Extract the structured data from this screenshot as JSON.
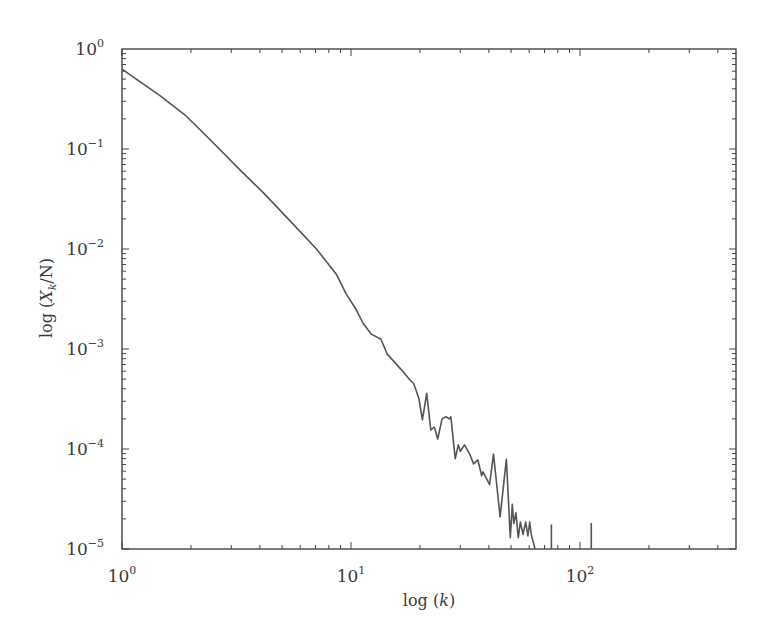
{
  "chart_data": {
    "type": "line",
    "title": "",
    "xlabel": "log (k)",
    "ylabel": "log (X_k/N)",
    "xscale": "log",
    "yscale": "log",
    "xlim": [
      1,
      480
    ],
    "ylim": [
      1e-05,
      1
    ],
    "grid": false,
    "legend": null,
    "x_ticks": [
      {
        "value": 1,
        "base": "10",
        "exp": "0"
      },
      {
        "value": 10,
        "base": "10",
        "exp": "1"
      },
      {
        "value": 100,
        "base": "10",
        "exp": "2"
      }
    ],
    "y_ticks": [
      {
        "value": 1,
        "base": "10",
        "exp": "0"
      },
      {
        "value": 0.1,
        "base": "10",
        "exp": "−1"
      },
      {
        "value": 0.01,
        "base": "10",
        "exp": "−2"
      },
      {
        "value": 0.001,
        "base": "10",
        "exp": "−3"
      },
      {
        "value": 0.0001,
        "base": "10",
        "exp": "−4"
      },
      {
        "value": 1e-05,
        "base": "10",
        "exp": "−5"
      }
    ],
    "series": [
      {
        "name": "X_k/N",
        "color": "#555555",
        "x": [
          1.0,
          1.47,
          1.88,
          2.41,
          3.25,
          4.17,
          5.43,
          7.07,
          8.63,
          9.5,
          10.5,
          11.3,
          12.3,
          13.5,
          14.4,
          16.5,
          18.1,
          18.8,
          19.8,
          20.5,
          21.4,
          22.3,
          23.1,
          23.9,
          25.0,
          26.0,
          26.9,
          27.3,
          28.5,
          29.4,
          30.0,
          31.3,
          33.0,
          34.3,
          35.8,
          37.2,
          37.7,
          40.3,
          41.9,
          44.8,
          47.7,
          49.6,
          50.6,
          51.4,
          52.5,
          53.8,
          54.9,
          56.4,
          57.9,
          59.2,
          60.3,
          61.2,
          63.7
        ],
        "y": [
          0.63,
          0.34,
          0.22,
          0.126,
          0.063,
          0.036,
          0.019,
          0.01,
          0.0056,
          0.0036,
          0.0025,
          0.0018,
          0.0014,
          0.00126,
          0.00089,
          0.00063,
          0.00049,
          0.00045,
          0.00032,
          0.000196,
          0.00036,
          0.000155,
          0.000166,
          0.000126,
          0.0002,
          0.00021,
          0.0002,
          0.00021,
          8e-05,
          0.00011,
          9.5e-05,
          0.00011,
          8.9e-05,
          7.1e-05,
          7.8e-05,
          5.4e-05,
          5.9e-05,
          4.4e-05,
          8.9e-05,
          2.1e-05,
          7.9e-05,
          1.3e-05,
          2.8e-05,
          1.8e-05,
          2.3e-05,
          1.3e-05,
          1.86e-05,
          1.4e-05,
          1.86e-05,
          1.35e-05,
          1.86e-05,
          1.4e-05,
          1e-05
        ],
        "isolated_spikes": [
          {
            "x": 75,
            "y": 1.76e-05
          },
          {
            "x": 112,
            "y": 1.82e-05
          }
        ]
      }
    ]
  },
  "labels": {
    "xlabel_pre": "log (",
    "xlabel_var": "k",
    "xlabel_post": ")",
    "ylabel_pre": "log (",
    "ylabel_var": "X",
    "ylabel_sub": "k",
    "ylabel_post": "/N)"
  }
}
